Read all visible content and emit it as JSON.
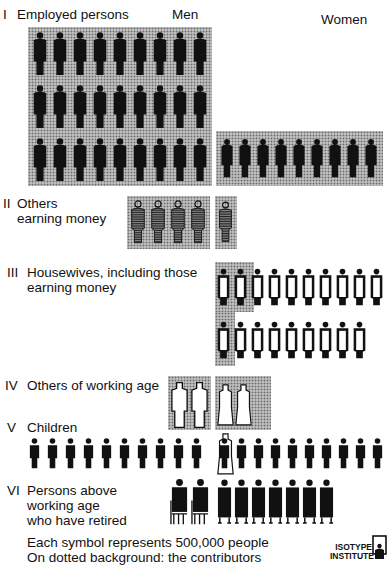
{
  "chart_data": {
    "type": "pictogram",
    "title": "",
    "unit": "Each symbol represents 500,000 people",
    "note": "On dotted background: the contributors",
    "columns": [
      "Men",
      "Women"
    ],
    "categories": [
      "I Employed persons",
      "II Others earning money",
      "III Housewives, including those earning money",
      "IV Others of working age",
      "V Children",
      "VI Persons above working age who have retired"
    ],
    "series": [
      {
        "name": "Men",
        "values": [
          27,
          4,
          0,
          2,
          10,
          2
        ]
      },
      {
        "name": "Women",
        "values": [
          9,
          1,
          19,
          3,
          10,
          7
        ]
      }
    ],
    "contributors": {
      "Men": [
        27,
        4,
        0,
        2,
        0,
        0
      ],
      "Women": [
        9,
        1,
        3,
        3,
        0,
        0
      ]
    },
    "symbol_value": 500000,
    "legend_position": "bottom"
  },
  "headers": {
    "men": "Men",
    "women": "Women"
  },
  "rows": {
    "r1": {
      "numeral": "I",
      "label": "Employed persons"
    },
    "r2": {
      "numeral": "II",
      "label1": "Others",
      "label2": "earning money"
    },
    "r3": {
      "numeral": "III",
      "label1": "Housewives, including those",
      "label2": "earning money"
    },
    "r4": {
      "numeral": "IV",
      "label": "Others of working age"
    },
    "r5": {
      "numeral": "V",
      "label": "Children"
    },
    "r6": {
      "numeral": "VI",
      "label1": "Persons above",
      "label2": "working age",
      "label3": "who have retired"
    }
  },
  "footer": {
    "line1": "Each symbol represents 500,000 people",
    "line2": "On dotted background: the contributors"
  },
  "logo": {
    "line1": "ISOTYPE",
    "line2": "INSTITUTE"
  }
}
